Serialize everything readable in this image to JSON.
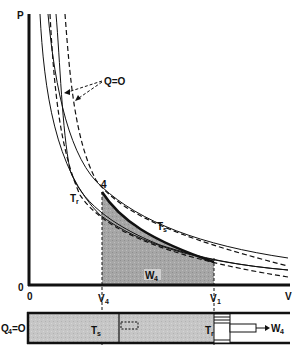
{
  "diagram": {
    "axes": {
      "y_label": "P",
      "x_label": "V",
      "origin_y_label": "0",
      "origin_x_label": "0",
      "tick_v4": "V",
      "tick_v4_sub": "4",
      "tick_v1": "V",
      "tick_v1_sub": "1"
    },
    "curves": {
      "adiabat_label": "Q=O",
      "isotherm_hot_label": "T",
      "isotherm_hot_sub": "s",
      "isotherm_cold_label": "T",
      "isotherm_cold_sub": "r"
    },
    "point_label": "4",
    "work_label": "W",
    "work_sub": "4",
    "cylinder": {
      "heat_label": "Q",
      "heat_sub": "4",
      "heat_value": "=O",
      "left_reservoir_label": "T",
      "left_reservoir_sub": "s",
      "right_reservoir_label": "T",
      "right_reservoir_sub": "r",
      "work_out_label": "W",
      "work_out_sub": "4"
    },
    "colors": {
      "ink": "#111111",
      "shade": "#a8a8a8",
      "cylinder_fill": "#c4c4c4"
    }
  }
}
